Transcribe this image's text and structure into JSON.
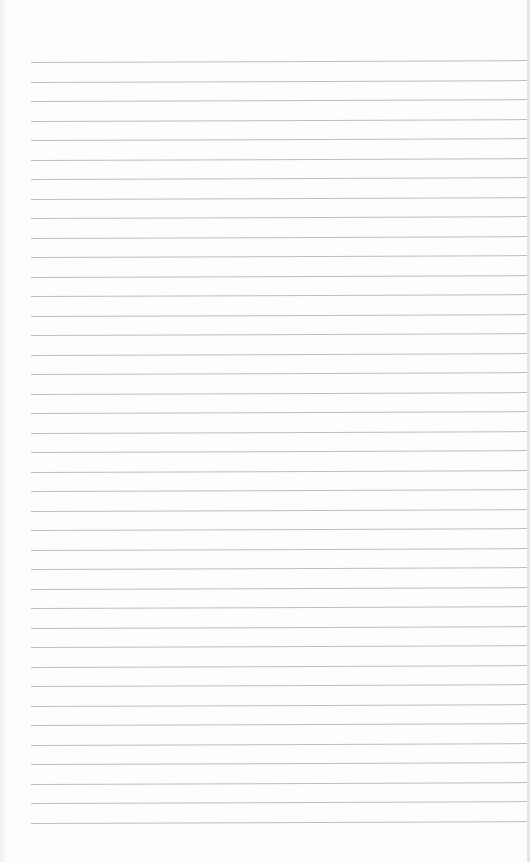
{
  "page": {
    "type": "blank ruled notebook paper",
    "background_color": "#fdfdfd",
    "line_color": "#bdbdbd"
  },
  "ruling": {
    "line_count": 40,
    "first_line_y": 62,
    "line_spacing": 19.5,
    "left_start_x": 31
  },
  "content": {
    "text": ""
  }
}
